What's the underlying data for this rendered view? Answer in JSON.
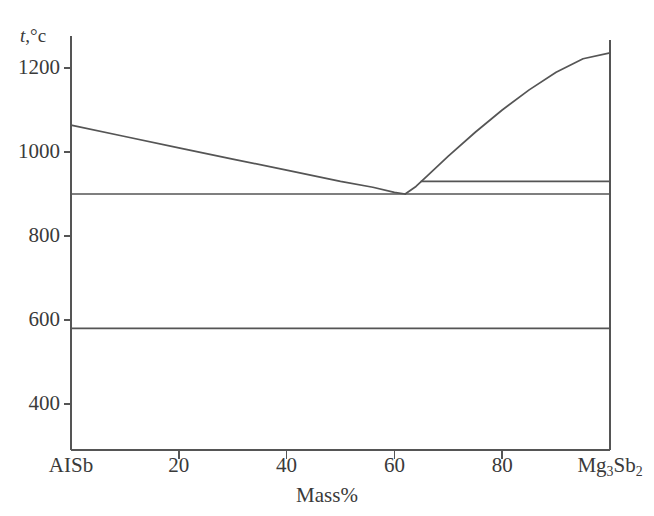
{
  "figure": {
    "name": "alsb-mg3sb2-phase-diagram",
    "line_color": "#555555",
    "text_color": "#3a3a3a",
    "background": "#ffffff"
  },
  "axes": {
    "y_title_symbol": "t",
    "y_title_unit": ",°c",
    "x_title": "Mass%",
    "y_ticks": [
      {
        "label": "1200",
        "value": 1200
      },
      {
        "label": "1000",
        "value": 1000
      },
      {
        "label": "800",
        "value": 800
      },
      {
        "label": "600",
        "value": 600
      },
      {
        "label": "400",
        "value": 400
      }
    ],
    "x_ticks": [
      {
        "label": "AISb",
        "value": 0,
        "type": "text"
      },
      {
        "label": "20",
        "value": 20,
        "type": "number"
      },
      {
        "label": "40",
        "value": 40,
        "type": "number"
      },
      {
        "label": "60",
        "value": 60,
        "type": "number"
      },
      {
        "label": "80",
        "value": 80,
        "type": "number"
      },
      {
        "label": "Mg3Sb2",
        "value": 100,
        "type": "formula"
      }
    ],
    "x_right_formula": {
      "base1": "Mg",
      "sub1": "3",
      "base2": "Sb",
      "sub2": "2"
    }
  },
  "chart_data": {
    "type": "line",
    "title": "",
    "subtitle": "",
    "xlabel": "Mass%",
    "ylabel": "t,°c",
    "xlim": [
      0,
      100
    ],
    "ylim": [
      330,
      1290
    ],
    "grid": false,
    "legend": null,
    "x_tick_labels": [
      "AISb",
      "20",
      "40",
      "60",
      "80",
      "Mg3Sb2"
    ],
    "x_tick_values": [
      0,
      20,
      40,
      60,
      80,
      100
    ],
    "y_tick_labels": [
      "1200",
      "1000",
      "800",
      "600",
      "400"
    ],
    "y_tick_values": [
      1200,
      1000,
      800,
      600,
      400
    ],
    "series": [
      {
        "name": "liquidus-left",
        "points": [
          [
            0,
            1064
          ],
          [
            10,
            1037
          ],
          [
            20,
            1010
          ],
          [
            30,
            983
          ],
          [
            40,
            957
          ],
          [
            50,
            930
          ],
          [
            56,
            916
          ],
          [
            60,
            904
          ],
          [
            62,
            900
          ]
        ]
      },
      {
        "name": "liquidus-right",
        "points": [
          [
            62,
            900
          ],
          [
            64,
            918
          ],
          [
            66,
            942
          ],
          [
            70,
            990
          ],
          [
            75,
            1047
          ],
          [
            80,
            1100
          ],
          [
            85,
            1148
          ],
          [
            90,
            1190
          ],
          [
            95,
            1222
          ],
          [
            100,
            1236
          ]
        ]
      },
      {
        "name": "eutectic-horizontal-900",
        "points": [
          [
            0,
            900
          ],
          [
            100,
            900
          ]
        ]
      },
      {
        "name": "upper-horizontal-930",
        "points": [
          [
            65,
            930
          ],
          [
            100,
            930
          ]
        ]
      },
      {
        "name": "lower-horizontal-580",
        "points": [
          [
            0,
            580
          ],
          [
            100,
            580
          ]
        ]
      }
    ],
    "annotations": [
      {
        "name": "eutectic-point",
        "x": 62,
        "y": 900,
        "label": ""
      }
    ]
  }
}
